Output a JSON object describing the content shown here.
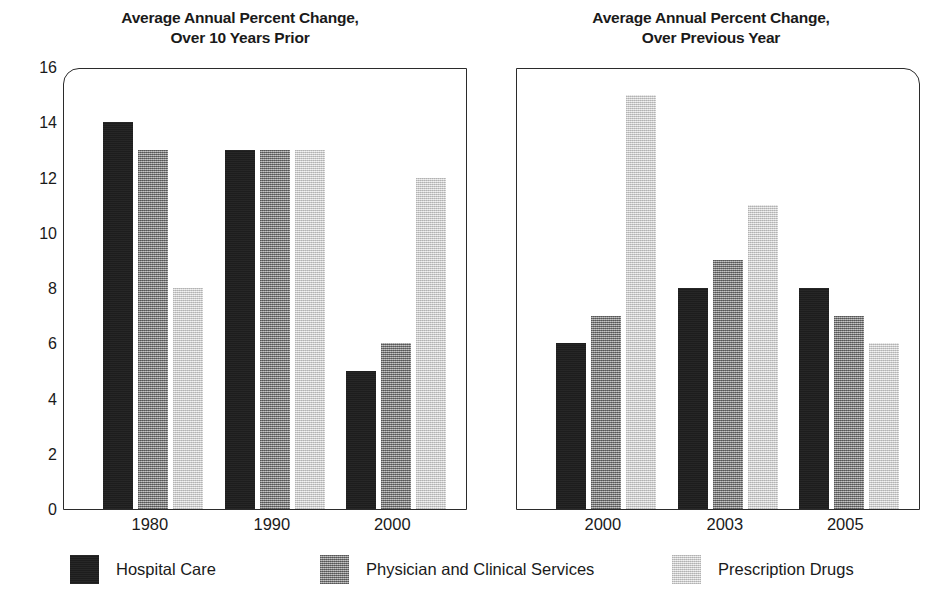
{
  "chart_data": [
    {
      "type": "bar",
      "title": "Average Annual Percent Change, Over 10 Years Prior",
      "title_lines": [
        "Average Annual Percent Change,",
        "Over 10 Years Prior"
      ],
      "categories": [
        "1980",
        "1990",
        "2000"
      ],
      "series": [
        {
          "name": "Hospital Care",
          "values": [
            14,
            13,
            5
          ],
          "color": "#1d1d1d"
        },
        {
          "name": "Physician and Clinical Services",
          "values": [
            13,
            13,
            6
          ],
          "color": "#8a8a8a"
        },
        {
          "name": "Prescription Drugs",
          "values": [
            8,
            13,
            12
          ],
          "color": "#dcdcdc"
        }
      ],
      "xlabel": "",
      "ylabel": "",
      "ylim": [
        0,
        16
      ],
      "yticks": [
        0,
        2,
        4,
        6,
        8,
        10,
        12,
        14,
        16
      ],
      "grid": false,
      "legend_position": "bottom"
    },
    {
      "type": "bar",
      "title": "Average Annual Percent Change, Over Previous Year",
      "title_lines": [
        "Average Annual Percent Change,",
        "Over Previous Year"
      ],
      "categories": [
        "2000",
        "2003",
        "2005"
      ],
      "series": [
        {
          "name": "Hospital Care",
          "values": [
            6,
            8,
            8
          ],
          "color": "#1d1d1d"
        },
        {
          "name": "Physician and Clinical Services",
          "values": [
            7,
            9,
            7
          ],
          "color": "#8a8a8a"
        },
        {
          "name": "Prescription Drugs",
          "values": [
            15,
            11,
            6
          ],
          "color": "#dcdcdc"
        }
      ],
      "xlabel": "",
      "ylabel": "",
      "ylim": [
        0,
        16
      ],
      "yticks": [
        0,
        2,
        4,
        6,
        8,
        10,
        12,
        14,
        16
      ],
      "grid": false,
      "legend_position": "bottom"
    }
  ],
  "legend": [
    {
      "label": "Hospital Care",
      "swatch": "dark"
    },
    {
      "label": "Physician and Clinical Services",
      "swatch": "mid"
    },
    {
      "label": "Prescription Drugs",
      "swatch": "light"
    }
  ],
  "colors": {
    "hospital_care": "#1d1d1d",
    "physician_and_clinical_services": "#8a8a8a",
    "prescription_drugs": "#dcdcdc",
    "axis": "#2b2b2b",
    "text": "#1a1a1a",
    "background": "#ffffff"
  }
}
